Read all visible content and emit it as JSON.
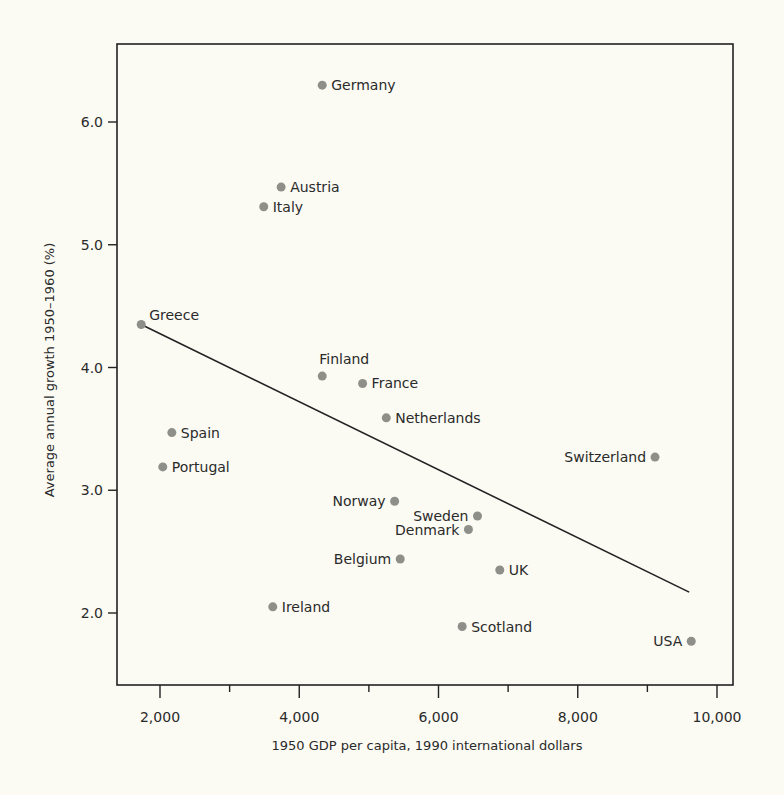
{
  "chart_data": {
    "type": "scatter",
    "title": "",
    "xlabel": "1950 GDP per capita, 1990 international dollars",
    "ylabel": "Average annual growth 1950–1960 (%)",
    "xlim": [
      1400,
      10200
    ],
    "ylim": [
      1.4,
      6.65
    ],
    "x_ticks": [
      2000,
      3000,
      4000,
      5000,
      6000,
      7000,
      8000,
      9000,
      10000
    ],
    "x_tick_labels": [
      {
        "value": 2000,
        "label": "2,000"
      },
      {
        "value": 4000,
        "label": "4,000"
      },
      {
        "value": 6000,
        "label": "6,000"
      },
      {
        "value": 8000,
        "label": "8,000"
      },
      {
        "value": 10000,
        "label": "10,000"
      }
    ],
    "y_ticks": [
      {
        "value": 2.0,
        "label": "2.0"
      },
      {
        "value": 3.0,
        "label": "3.0"
      },
      {
        "value": 4.0,
        "label": "4.0"
      },
      {
        "value": 5.0,
        "label": "5.0"
      },
      {
        "value": 6.0,
        "label": "6.0"
      }
    ],
    "grid": false,
    "legend": null,
    "points": [
      {
        "label": "Germany",
        "x": 4330,
        "y": 6.3,
        "label_side": "right"
      },
      {
        "label": "Austria",
        "x": 3740,
        "y": 5.47,
        "label_side": "right"
      },
      {
        "label": "Italy",
        "x": 3490,
        "y": 5.31,
        "label_side": "right"
      },
      {
        "label": "Greece",
        "x": 1730,
        "y": 4.35,
        "label_side": "above-right"
      },
      {
        "label": "Finland",
        "x": 4330,
        "y": 3.93,
        "label_side": "above"
      },
      {
        "label": "France",
        "x": 4910,
        "y": 3.87,
        "label_side": "right"
      },
      {
        "label": "Netherlands",
        "x": 5250,
        "y": 3.59,
        "label_side": "right"
      },
      {
        "label": "Spain",
        "x": 2170,
        "y": 3.47,
        "label_side": "right"
      },
      {
        "label": "Switzerland",
        "x": 9110,
        "y": 3.27,
        "label_side": "left"
      },
      {
        "label": "Portugal",
        "x": 2040,
        "y": 3.19,
        "label_side": "right"
      },
      {
        "label": "Norway",
        "x": 5370,
        "y": 2.91,
        "label_side": "left"
      },
      {
        "label": "Sweden",
        "x": 6560,
        "y": 2.79,
        "label_side": "left"
      },
      {
        "label": "Denmark",
        "x": 6430,
        "y": 2.68,
        "label_side": "left"
      },
      {
        "label": "Belgium",
        "x": 5450,
        "y": 2.44,
        "label_side": "left"
      },
      {
        "label": "UK",
        "x": 6880,
        "y": 2.35,
        "label_side": "right"
      },
      {
        "label": "Ireland",
        "x": 3620,
        "y": 2.05,
        "label_side": "right"
      },
      {
        "label": "Scotland",
        "x": 6340,
        "y": 1.89,
        "label_side": "right"
      },
      {
        "label": "USA",
        "x": 9630,
        "y": 1.77,
        "label_side": "left"
      }
    ],
    "trend_line": {
      "type": "linear fit",
      "start": {
        "x": 1730,
        "y": 4.35
      },
      "end": {
        "x": 9600,
        "y": 2.17
      }
    }
  },
  "style": {
    "background": "#fbfaf3",
    "point_color": "#8f8f8a",
    "line_color": "#222222",
    "text_color": "#2a2a2a"
  }
}
